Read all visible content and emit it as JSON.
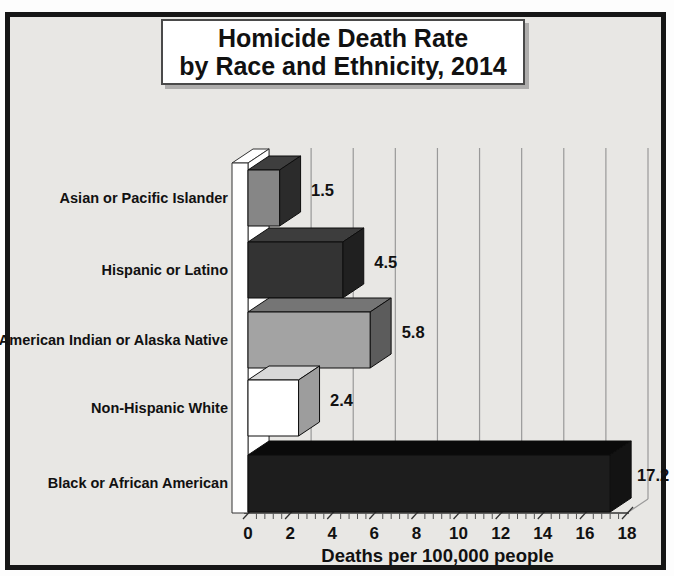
{
  "title": {
    "line1": "Homicide Death Rate",
    "line2": "by Race and Ethnicity, 2014"
  },
  "frame": {
    "background": "#e8e7e4",
    "border_color": "#161616"
  },
  "chart_data": {
    "type": "bar",
    "orientation": "horizontal",
    "style": "3d",
    "title": "Homicide Death Rate by Race and Ethnicity, 2014",
    "categories": [
      "Asian or Pacific Islander",
      "Hispanic or Latino",
      "American Indian or Alaska Native",
      "Non-Hispanic White",
      "Black or African American"
    ],
    "values": [
      1.5,
      4.5,
      5.8,
      2.4,
      17.2
    ],
    "value_labels": [
      "1.5",
      "4.5",
      "5.8",
      "2.4",
      "17.2"
    ],
    "xlabel": "Deaths per 100,000 people",
    "xlim": [
      0,
      18
    ],
    "xticks": [
      0,
      2,
      4,
      6,
      8,
      10,
      12,
      14,
      16,
      18
    ],
    "minor_tick_step": 0.4,
    "grid": true,
    "legend": false,
    "bar_colors": [
      {
        "front": "#868686",
        "top": "#3e3e3e",
        "side": "#2b2b2b"
      },
      {
        "front": "#333333",
        "top": "#3d3d3d",
        "side": "#202020"
      },
      {
        "front": "#a3a3a3",
        "top": "#757575",
        "side": "#5c5c5c"
      },
      {
        "front": "#ffffff",
        "top": "#d8d8d8",
        "side": "#9d9d9d"
      },
      {
        "front": "#1d1d1d",
        "top": "#0a0a0a",
        "side": "#131313"
      }
    ],
    "text_color": "#111111",
    "gridline_color": "#999999",
    "axis_color": "#333333",
    "wall_color": "#ffffff"
  }
}
